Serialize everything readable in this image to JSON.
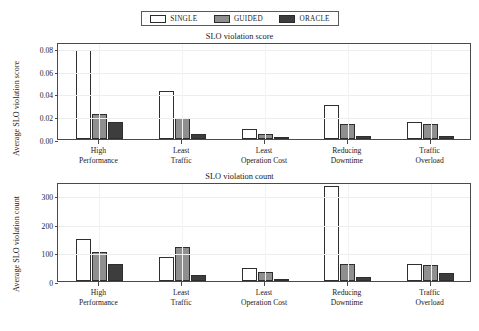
{
  "legend": {
    "entries": [
      {
        "label": "SINGLE",
        "color": "#ffffff",
        "key": "single"
      },
      {
        "label": "GUIDED",
        "color": "#8f8f8f",
        "key": "guided"
      },
      {
        "label": "ORACLE",
        "color": "#3d3d3d",
        "key": "oracle"
      }
    ]
  },
  "chart_data": [
    {
      "type": "bar",
      "title": "SLO violation score",
      "xlabel": "",
      "ylabel": "Average SLO violation score",
      "categories": [
        "High\nPerformance",
        "Least\nTraffic",
        "Least\nOperation Cost",
        "Reducing\nDowntime",
        "Traffic\nOverload"
      ],
      "category_lines": [
        [
          "High",
          "Performance"
        ],
        [
          "Least",
          "Traffic"
        ],
        [
          "Least",
          "Operation Cost"
        ],
        [
          "Reducing",
          "Downtime"
        ],
        [
          "Traffic",
          "Overload"
        ]
      ],
      "ylim": [
        0.0,
        0.085
      ],
      "yticks": [
        0.0,
        0.02,
        0.04,
        0.06,
        0.08
      ],
      "ytick_labels": [
        "0.00",
        "0.02",
        "0.04",
        "0.06",
        "0.08"
      ],
      "grid": true,
      "legend_position": "above",
      "series": [
        {
          "name": "SINGLE",
          "values": [
            0.078,
            0.042,
            0.009,
            0.03,
            0.015
          ]
        },
        {
          "name": "GUIDED",
          "values": [
            0.022,
            0.018,
            0.004,
            0.013,
            0.013
          ]
        },
        {
          "name": "ORACLE",
          "values": [
            0.015,
            0.004,
            0.002,
            0.003,
            0.003
          ]
        }
      ]
    },
    {
      "type": "bar",
      "title": "SLO violation count",
      "xlabel": "",
      "ylabel": "Average SLO violation count",
      "categories": [
        "High\nPerformance",
        "Least\nTraffic",
        "Least\nOperation Cost",
        "Reducing\nDowntime",
        "Traffic\nOverload"
      ],
      "category_lines": [
        [
          "High",
          "Performance"
        ],
        [
          "Least",
          "Traffic"
        ],
        [
          "Least",
          "Operation Cost"
        ],
        [
          "Reducing",
          "Downtime"
        ],
        [
          "Traffic",
          "Overload"
        ]
      ],
      "ylim": [
        0,
        345
      ],
      "yticks": [
        0,
        100,
        200,
        300
      ],
      "ytick_labels": [
        "0",
        "100",
        "200",
        "300"
      ],
      "grid": true,
      "legend_position": "above",
      "series": [
        {
          "name": "SINGLE",
          "values": [
            145,
            82,
            45,
            330,
            58
          ]
        },
        {
          "name": "GUIDED",
          "values": [
            100,
            120,
            32,
            58,
            55
          ]
        },
        {
          "name": "ORACLE",
          "values": [
            60,
            22,
            8,
            15,
            27
          ]
        }
      ]
    }
  ]
}
